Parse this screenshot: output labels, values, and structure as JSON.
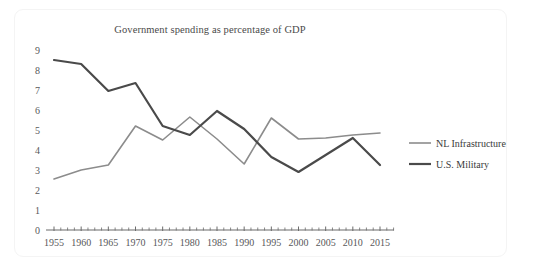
{
  "chart_data": {
    "type": "line",
    "title": "Government spending as percentage of GDP",
    "xlabel": "",
    "ylabel": "",
    "x": [
      1955,
      1960,
      1965,
      1970,
      1975,
      1980,
      1985,
      1990,
      1995,
      2000,
      2005,
      2010,
      2015
    ],
    "categories": [
      "1955",
      "1960",
      "1965",
      "1970",
      "1975",
      "1980",
      "1985",
      "1990",
      "1995",
      "2000",
      "2005",
      "2010",
      "2015"
    ],
    "xlim": [
      1952.5,
      2017.5
    ],
    "ylim": [
      0,
      9
    ],
    "yticks": [
      0,
      1,
      2,
      3,
      4,
      5,
      6,
      7,
      8,
      9
    ],
    "ytick_labels": [
      "0",
      "1",
      "2",
      "3",
      "4",
      "5",
      "6",
      "7",
      "8",
      "9"
    ],
    "xtick_labels": [
      "1955",
      "1960",
      "1965",
      "1970",
      "1975",
      "1980",
      "1985",
      "1990",
      "1995",
      "2000",
      "2005",
      "2010",
      "2015"
    ],
    "grid": false,
    "legend_position": "right",
    "minor_ticks_per_interval": 3,
    "series": [
      {
        "name": "NL Infrastructure",
        "color": "#8c8c8c",
        "width": 1.6,
        "values": [
          2.55,
          3.0,
          3.25,
          5.2,
          4.5,
          5.65,
          4.55,
          3.3,
          5.6,
          4.55,
          4.6,
          4.75,
          4.85
        ]
      },
      {
        "name": "U.S. Military",
        "color": "#4a4a4a",
        "width": 2.2,
        "values": [
          8.5,
          8.3,
          6.95,
          7.35,
          5.2,
          4.75,
          5.95,
          5.05,
          3.65,
          2.9,
          3.75,
          4.6,
          3.25
        ]
      }
    ]
  },
  "legend": {
    "items": [
      {
        "label": "NL Infrastructure",
        "color": "#8c8c8c"
      },
      {
        "label": "U.S. Military",
        "color": "#4a4a4a"
      }
    ]
  },
  "colors": {
    "axis": "#6b6b6b",
    "text": "#4a4a4a",
    "background": "#ffffff",
    "frame": "#f4f4f4"
  }
}
